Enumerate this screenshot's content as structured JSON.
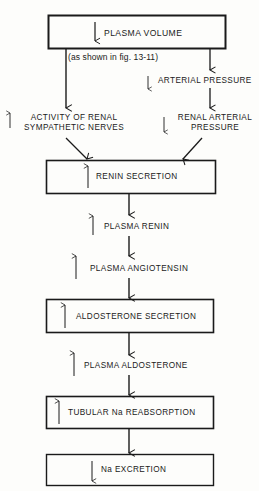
{
  "diagram": {
    "type": "flowchart",
    "nodes": {
      "plasma_volume": {
        "label": "PLASMA VOLUME",
        "direction": "down",
        "boxed": true
      },
      "note": {
        "label": "(as shown in fig. 13-11)"
      },
      "arterial_pressure": {
        "label": "ARTERIAL PRESSURE",
        "direction": "down"
      },
      "sympathetic": {
        "line1": "ACTIVITY OF RENAL",
        "line2": "SYMPATHETIC NERVES",
        "direction": "up"
      },
      "renal_arterial": {
        "line1": "RENAL ARTERIAL",
        "line2": "PRESSURE",
        "direction": "down"
      },
      "renin_secretion": {
        "label": "RENIN SECRETION",
        "direction": "up",
        "boxed": true
      },
      "plasma_renin": {
        "label": "PLASMA RENIN",
        "direction": "up"
      },
      "plasma_angiotensin": {
        "label": "PLASMA ANGIOTENSIN",
        "direction": "up"
      },
      "aldosterone_secretion": {
        "label": "ALDOSTERONE SECRETION",
        "direction": "up",
        "boxed": true
      },
      "plasma_aldosterone": {
        "label": "PLASMA ALDOSTERONE",
        "direction": "up"
      },
      "tubular_reabsorption": {
        "label": "TUBULAR Na REABSORPTION",
        "direction": "up",
        "boxed": true
      },
      "na_excretion": {
        "label": "Na EXCRETION",
        "direction": "down",
        "boxed": true
      }
    },
    "colors": {
      "line": "#1a1a1a",
      "background": "#fdfdfb"
    }
  }
}
